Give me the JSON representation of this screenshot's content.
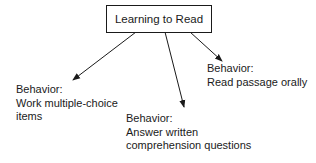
{
  "root": {
    "label": "Learning to Read"
  },
  "children": [
    {
      "heading": "Behavior:",
      "lines": [
        "Work multiple-choice",
        "items"
      ]
    },
    {
      "heading": "Behavior:",
      "lines": [
        "Answer written",
        "comprehension questions"
      ]
    },
    {
      "heading": "Behavior:",
      "lines": [
        "Read passage orally"
      ]
    }
  ],
  "colors": {
    "line": "#1a1a1a",
    "background": "#ffffff"
  }
}
